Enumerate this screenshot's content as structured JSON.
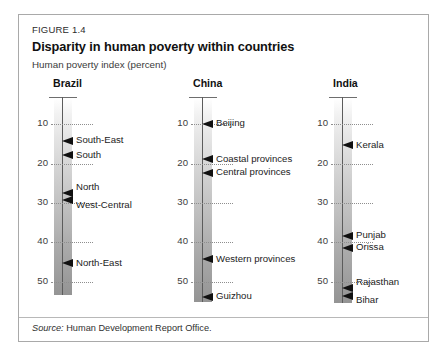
{
  "figure": {
    "number": "FIGURE 1.4",
    "title": "Disparity in human poverty within countries",
    "subtitle": "Human poverty index (percent)",
    "source_prefix": "Source:",
    "source_text": "Human Development Report Office."
  },
  "axis": {
    "min": 3.3,
    "max": 56.0,
    "ticks": [
      10,
      20,
      30,
      40,
      50
    ],
    "tick_labels": [
      "10",
      "20",
      "30",
      "40",
      "50"
    ],
    "unit": "percent"
  },
  "colors": {
    "frame": "#a9a9a9",
    "marker": "#111111",
    "bar_top": "#ffffff",
    "bar_bottom": "#949494",
    "centerline": "#5c5c5c",
    "tick": "#8e8e8e",
    "text": "#1c1c1c"
  },
  "chart_data": {
    "type": "scatter",
    "title": "Disparity in human poverty within countries",
    "subtitle": "Human poverty index (percent)",
    "xlabel": "",
    "ylabel": "Human poverty index (percent)",
    "ylim": [
      3.3,
      56
    ],
    "yticks": [
      10,
      20,
      30,
      40,
      50
    ],
    "grid": "dotted horizontal ticks only",
    "legend": "none",
    "orientation": "vertical-scale-strips",
    "series": [
      {
        "name": "Brazil",
        "points": [
          {
            "label": "South-East",
            "value": 14.3
          },
          {
            "label": "South",
            "value": 18.0
          },
          {
            "label": "North",
            "value": 27.5
          },
          {
            "label": "West-Central",
            "value": 29.5
          },
          {
            "label": "North-East",
            "value": 45.5
          }
        ]
      },
      {
        "name": "China",
        "points": [
          {
            "label": "Beijing",
            "value": 10.0
          },
          {
            "label": "Coastal provinces",
            "value": 19.0
          },
          {
            "label": "Central provinces",
            "value": 22.5
          },
          {
            "label": "Western provinces",
            "value": 44.5
          },
          {
            "label": "Guizhou",
            "value": 54.0
          }
        ]
      },
      {
        "name": "India",
        "points": [
          {
            "label": "Kerala",
            "value": 15.5
          },
          {
            "label": "Punjab",
            "value": 38.5
          },
          {
            "label": "Orissa",
            "value": 41.5
          },
          {
            "label": "Rajasthan",
            "value": 51.7
          },
          {
            "label": "Bihar",
            "value": 53.8
          }
        ]
      }
    ]
  },
  "panels": [
    {
      "id": "brazil",
      "title": "Brazil",
      "bar_bottom_value": 53.5,
      "markers": [
        {
          "label": "South-East",
          "value": 14.3,
          "label_pos": "middle"
        },
        {
          "label": "South",
          "value": 18.0,
          "label_pos": "middle"
        },
        {
          "label": "North",
          "value": 27.5,
          "label_pos": "above"
        },
        {
          "label": "West-Central",
          "value": 29.5,
          "label_pos": "below"
        },
        {
          "label": "North-East",
          "value": 45.5,
          "label_pos": "middle"
        }
      ]
    },
    {
      "id": "china",
      "title": "China",
      "bar_bottom_value": 55.3,
      "markers": [
        {
          "label": "Beijing",
          "value": 10.0,
          "label_pos": "middle"
        },
        {
          "label": "Coastal provinces",
          "value": 19.0,
          "label_pos": "middle"
        },
        {
          "label": "Central provinces",
          "value": 22.5,
          "label_pos": "middle"
        },
        {
          "label": "Western provinces",
          "value": 44.5,
          "label_pos": "middle"
        },
        {
          "label": "Guizhou",
          "value": 54.0,
          "label_pos": "middle"
        }
      ]
    },
    {
      "id": "india",
      "title": "India",
      "bar_bottom_value": 55.5,
      "markers": [
        {
          "label": "Kerala",
          "value": 15.5,
          "label_pos": "middle"
        },
        {
          "label": "Punjab",
          "value": 38.5,
          "label_pos": "middle"
        },
        {
          "label": "Orissa",
          "value": 41.5,
          "label_pos": "middle"
        },
        {
          "label": "Rajasthan",
          "value": 51.7,
          "label_pos": "above"
        },
        {
          "label": "Bihar",
          "value": 53.8,
          "label_pos": "below"
        }
      ]
    }
  ]
}
